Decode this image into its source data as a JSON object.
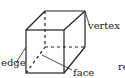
{
  "diagram": {
    "type": "cube-parts",
    "labels": {
      "vertex": "vertex",
      "edge": "edge",
      "face": "face",
      "cut_off_text": "re"
    },
    "colors": {
      "stroke": "#222222",
      "background": "#ffffff"
    }
  }
}
